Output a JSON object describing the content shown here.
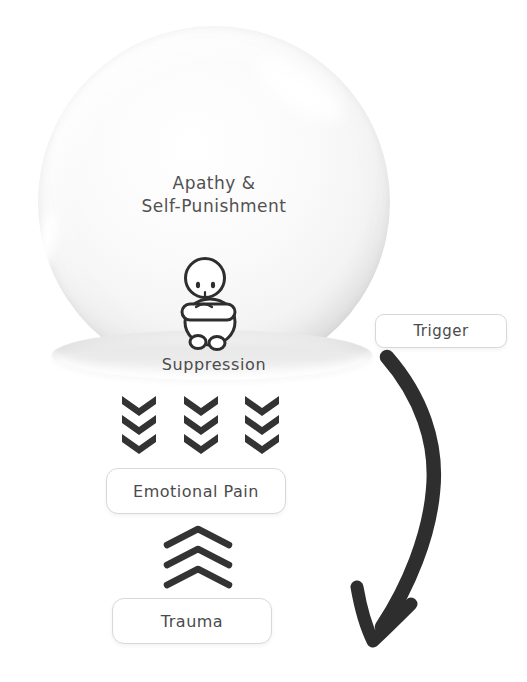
{
  "globe": {
    "caption_line1": "Apathy &",
    "caption_line2": "Self-Punishment",
    "base_label": "Suppression",
    "person_icon": "person-sitting-hugging-knees"
  },
  "flow": {
    "trigger": "Trigger",
    "emotional_pain": "Emotional Pain",
    "trauma": "Trauma"
  },
  "icons": {
    "down_chevrons": "triple-chevron-down-columns",
    "up_chevrons": "triple-chevron-up",
    "curved_arrow": "curved-arrow-down"
  },
  "colors": {
    "ink": "#2e2e2e",
    "chevron": "#333333",
    "text": "#4b4b4b",
    "box_border": "#d8d8d8",
    "globe_edge": "#e6e6e6",
    "base_fill": "#ebebeb",
    "background": "#ffffff"
  }
}
